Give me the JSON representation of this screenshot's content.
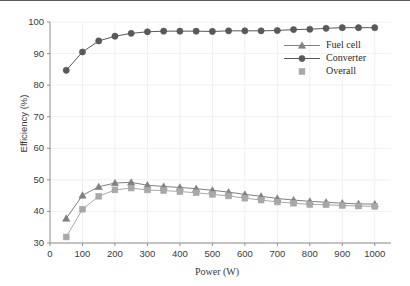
{
  "chart_data": {
    "type": "line",
    "title": "",
    "xlabel": "Power (W)",
    "ylabel": "Efficiency (%)",
    "xlim": [
      0,
      1050
    ],
    "ylim": [
      30,
      100
    ],
    "xticks": [
      0,
      100,
      200,
      300,
      400,
      500,
      600,
      700,
      800,
      900,
      1000
    ],
    "yticks": [
      30,
      40,
      50,
      60,
      70,
      80,
      90,
      100
    ],
    "grid": true,
    "legend_position": "upper-right",
    "x": [
      50,
      100,
      150,
      200,
      250,
      300,
      350,
      400,
      450,
      500,
      550,
      600,
      650,
      700,
      750,
      800,
      850,
      900,
      950,
      1000
    ],
    "series": [
      {
        "name": "Fuel cell",
        "marker": "triangle",
        "color": "#808080",
        "values": [
          37.8,
          45.1,
          47.8,
          49.0,
          49.2,
          48.3,
          47.9,
          47.6,
          47.2,
          46.7,
          46.1,
          45.4,
          44.8,
          44.1,
          43.6,
          43.2,
          42.9,
          42.6,
          42.4,
          42.3
        ]
      },
      {
        "name": "Converter",
        "marker": "circle",
        "color": "#595959",
        "values": [
          84.7,
          90.5,
          94.0,
          95.5,
          96.4,
          96.9,
          97.1,
          97.1,
          97.1,
          97.0,
          97.2,
          97.2,
          97.2,
          97.3,
          97.6,
          97.7,
          98.0,
          98.2,
          98.2,
          98.2
        ]
      },
      {
        "name": "Overall",
        "marker": "square",
        "color": "#a8a8a8",
        "values": [
          31.9,
          40.7,
          44.8,
          46.8,
          47.4,
          46.8,
          46.6,
          46.3,
          45.9,
          45.4,
          44.9,
          44.2,
          43.6,
          43.0,
          42.6,
          42.2,
          42.1,
          41.9,
          41.7,
          41.6
        ]
      }
    ]
  },
  "axis": {
    "ylabel": "Efficiency (%)",
    "xlabel": "Power (W)",
    "yticks": [
      "100",
      "90",
      "80",
      "70",
      "60",
      "50",
      "40",
      "30"
    ],
    "xticks": [
      "0",
      "100",
      "200",
      "300",
      "400",
      "500",
      "600",
      "700",
      "800",
      "900",
      "1000"
    ]
  },
  "legend": {
    "items": [
      {
        "label": "Fuel cell",
        "icon": "line-triangle-marker-icon"
      },
      {
        "label": "Converter",
        "icon": "line-circle-marker-icon"
      },
      {
        "label": "Overall",
        "icon": "square-marker-icon"
      }
    ]
  },
  "colors": {
    "fuel_cell": "#808080",
    "converter": "#595959",
    "overall": "#a8a8a8",
    "axis": "#8f8f8f",
    "grid": "#f0f0f0",
    "text": "#3a3a3a",
    "top_rule": "#5a5a5a"
  }
}
